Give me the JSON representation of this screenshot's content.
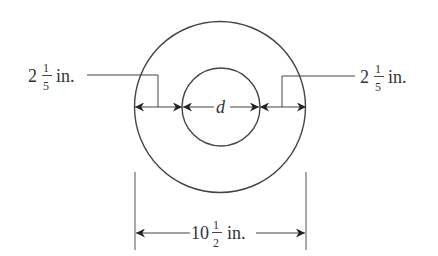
{
  "diagram": {
    "type": "concentric-circles-dimension",
    "left_label": {
      "whole": "2",
      "num": "1",
      "den": "5",
      "unit": "in."
    },
    "right_label": {
      "whole": "2",
      "num": "1",
      "den": "5",
      "unit": "in."
    },
    "center_label": "d",
    "bottom_label": {
      "whole": "10",
      "num": "1",
      "den": "2",
      "unit": "in."
    },
    "colors": {
      "stroke": "#444444",
      "text": "#333333",
      "background": "#ffffff"
    }
  }
}
